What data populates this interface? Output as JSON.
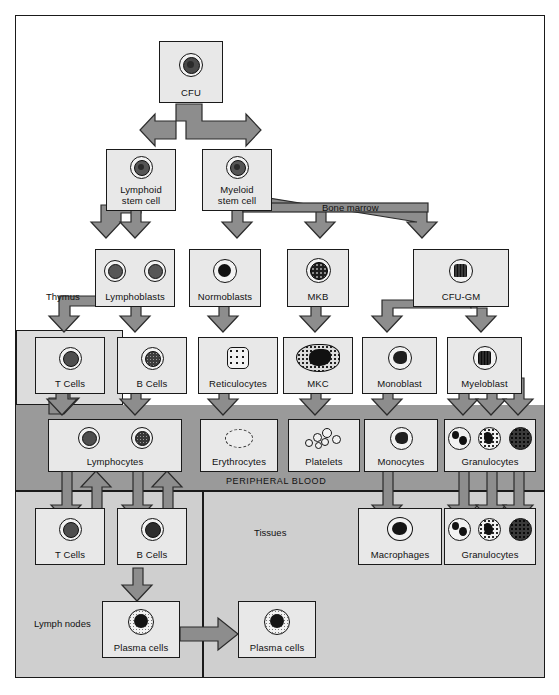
{
  "diagram": {
    "regions": [
      {
        "id": "bone-marrow",
        "label": "Bone marrow"
      },
      {
        "id": "thymus",
        "label": "Thymus"
      },
      {
        "id": "peripheral-blood",
        "label": "PERIPHERAL BLOOD"
      },
      {
        "id": "lymph-nodes",
        "label": "Lymph nodes"
      },
      {
        "id": "tissues",
        "label": "Tissues"
      }
    ],
    "nodes": [
      {
        "id": "cfu",
        "label": "CFU",
        "row": "stem",
        "glyphs": [
          "stem-cell"
        ]
      },
      {
        "id": "lymphoid-stem-cell",
        "label": "Lymphoid\nstem cell",
        "row": "stem2",
        "glyphs": [
          "stem-cell"
        ]
      },
      {
        "id": "myeloid-stem-cell",
        "label": "Myeloid\nstem cell",
        "row": "stem2",
        "glyphs": [
          "stem-cell"
        ]
      },
      {
        "id": "lymphoblasts",
        "label": "Lymphoblasts",
        "row": "blast",
        "glyphs": [
          "lymphoblast",
          "lymphoblast"
        ]
      },
      {
        "id": "normoblasts",
        "label": "Normoblasts",
        "row": "blast",
        "glyphs": [
          "normoblast"
        ]
      },
      {
        "id": "mkb",
        "label": "MKB",
        "row": "blast",
        "glyphs": [
          "megakaryoblast"
        ]
      },
      {
        "id": "cfu-gm",
        "label": "CFU-GM",
        "row": "blast",
        "glyphs": [
          "cfu-gm-cell"
        ]
      },
      {
        "id": "t-cells-marrow",
        "label": "T Cells",
        "row": "precursor",
        "glyphs": [
          "t-cell"
        ]
      },
      {
        "id": "b-cells-marrow",
        "label": "B Cells",
        "row": "precursor",
        "glyphs": [
          "b-cell"
        ]
      },
      {
        "id": "reticulocytes",
        "label": "Reticulocytes",
        "row": "precursor",
        "glyphs": [
          "reticulocyte"
        ]
      },
      {
        "id": "mkc",
        "label": "MKC",
        "row": "precursor",
        "glyphs": [
          "megakaryocyte"
        ]
      },
      {
        "id": "monoblast",
        "label": "Monoblast",
        "row": "precursor",
        "glyphs": [
          "monoblast"
        ]
      },
      {
        "id": "myeloblast",
        "label": "Myeloblast",
        "row": "precursor",
        "glyphs": [
          "myeloblast"
        ]
      },
      {
        "id": "lymphocytes",
        "label": "Lymphocytes",
        "row": "blood",
        "glyphs": [
          "t-cell",
          "b-cell"
        ]
      },
      {
        "id": "erythrocytes",
        "label": "Erythrocytes",
        "row": "blood",
        "glyphs": [
          "erythrocyte"
        ]
      },
      {
        "id": "platelets",
        "label": "Platelets",
        "row": "blood",
        "glyphs": [
          "platelets"
        ]
      },
      {
        "id": "monocytes",
        "label": "Monocytes",
        "row": "blood",
        "glyphs": [
          "monocyte"
        ]
      },
      {
        "id": "granulocytes-blood",
        "label": "Granulocytes",
        "row": "blood",
        "glyphs": [
          "neutrophil",
          "eosinophil",
          "basophil"
        ]
      },
      {
        "id": "t-cells-lymph",
        "label": "T Cells",
        "row": "tissue",
        "glyphs": [
          "t-cell"
        ]
      },
      {
        "id": "b-cells-lymph",
        "label": "B Cells",
        "row": "tissue",
        "glyphs": [
          "b-cell"
        ]
      },
      {
        "id": "macrophages",
        "label": "Macrophages",
        "row": "tissue",
        "glyphs": [
          "macrophage"
        ]
      },
      {
        "id": "granulocytes-tissue",
        "label": "Granulocytes",
        "row": "tissue",
        "glyphs": [
          "neutrophil",
          "eosinophil",
          "basophil"
        ]
      },
      {
        "id": "plasma-cells-lymph",
        "label": "Plasma cells",
        "row": "plasma",
        "glyphs": [
          "plasma-cell"
        ]
      },
      {
        "id": "plasma-cells-tissue",
        "label": "Plasma cells",
        "row": "plasma",
        "glyphs": [
          "plasma-cell"
        ]
      }
    ],
    "colors": {
      "arrow_fill": "#8d8d8d",
      "arrow_stroke": "#2b2b2b",
      "box_fill": "#e8e8e8",
      "box_stroke": "#1a1a1a",
      "peripheral_blood_band": "#9a9a9a",
      "tissue_band": "#cfcfcf",
      "thymus_band": "#dcdcdc",
      "page_background": "#ffffff"
    }
  }
}
